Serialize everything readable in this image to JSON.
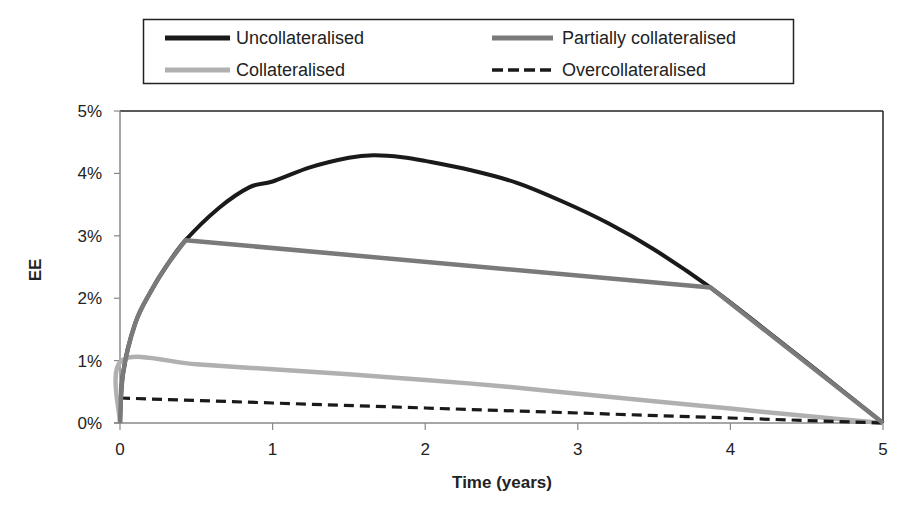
{
  "chart_data": {
    "type": "line",
    "title": "",
    "xlabel": "Time (years)",
    "ylabel": "EE",
    "xlim": [
      0,
      5
    ],
    "ylim": [
      0,
      5
    ],
    "x_ticks": [
      "0",
      "1",
      "2",
      "3",
      "4",
      "5"
    ],
    "y_ticks": [
      "0%",
      "1%",
      "2%",
      "3%",
      "4%",
      "5%"
    ],
    "grid": false,
    "legend_position": "top",
    "series": [
      {
        "name": "Uncollateralised",
        "color": "#1a1a1a",
        "style": "solid",
        "x": [
          0,
          0.02,
          0.1,
          0.2,
          0.3,
          0.43,
          0.65,
          0.85,
          1.0,
          1.25,
          1.5,
          1.66,
          1.85,
          2.0,
          2.3,
          2.6,
          2.9,
          3.2,
          3.5,
          3.87,
          4.2,
          4.6,
          5.0
        ],
        "values": [
          0,
          0.8,
          1.6,
          2.1,
          2.5,
          2.93,
          3.45,
          3.78,
          3.87,
          4.1,
          4.25,
          4.29,
          4.26,
          4.2,
          4.05,
          3.85,
          3.55,
          3.2,
          2.78,
          2.17,
          1.55,
          0.78,
          0
        ]
      },
      {
        "name": "Partially collateralised",
        "color": "#7a7a7a",
        "style": "solid",
        "x": [
          0,
          0.02,
          0.1,
          0.2,
          0.3,
          0.43,
          3.87,
          5.0
        ],
        "values": [
          0,
          0.8,
          1.6,
          2.1,
          2.5,
          2.93,
          2.17,
          0
        ]
      },
      {
        "name": "Collateralised",
        "color": "#b0b0b0",
        "style": "solid",
        "x": [
          0,
          0.01,
          0.5,
          1.0,
          1.5,
          2.0,
          2.5,
          3.0,
          3.5,
          4.0,
          4.5,
          5.0
        ],
        "values": [
          0,
          1.0,
          0.94,
          0.86,
          0.78,
          0.69,
          0.59,
          0.47,
          0.35,
          0.23,
          0.11,
          0
        ]
      },
      {
        "name": "Overcollateralised",
        "color": "#1a1a1a",
        "style": "dashed",
        "x": [
          0,
          1.0,
          2.0,
          3.0,
          4.0,
          5.0
        ],
        "values": [
          0.4,
          0.32,
          0.24,
          0.16,
          0.08,
          0
        ]
      }
    ]
  },
  "legend": {
    "items": [
      {
        "label": "Uncollateralised"
      },
      {
        "label": "Partially collateralised"
      },
      {
        "label": "Collateralised"
      },
      {
        "label": "Overcollateralised"
      }
    ]
  },
  "axes": {
    "x_title": "Time (years)",
    "y_title": "EE",
    "x_ticks": [
      "0",
      "1",
      "2",
      "3",
      "4",
      "5"
    ],
    "y_ticks": [
      "0%",
      "1%",
      "2%",
      "3%",
      "4%",
      "5%"
    ]
  }
}
